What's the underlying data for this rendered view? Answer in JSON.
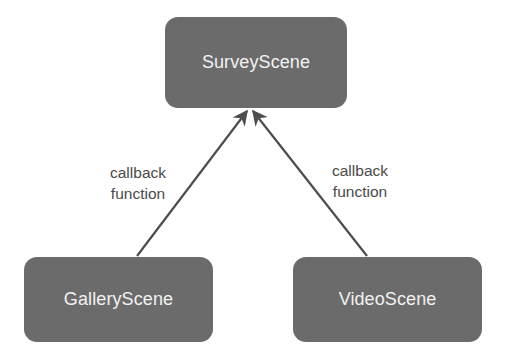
{
  "diagram": {
    "nodes": [
      {
        "id": "survey",
        "label": "SurveyScene"
      },
      {
        "id": "gallery",
        "label": "GalleryScene"
      },
      {
        "id": "video",
        "label": "VideoScene"
      }
    ],
    "edges": [
      {
        "from": "gallery",
        "to": "survey",
        "label_line1": "callback",
        "label_line2": "function"
      },
      {
        "from": "video",
        "to": "survey",
        "label_line1": "callback",
        "label_line2": "function"
      }
    ],
    "colors": {
      "node_fill": "#6b6b6b",
      "node_text": "#f2f2f2",
      "edge": "#4d4d4d",
      "edge_label": "#4a4a4a",
      "background": "#ffffff"
    }
  }
}
